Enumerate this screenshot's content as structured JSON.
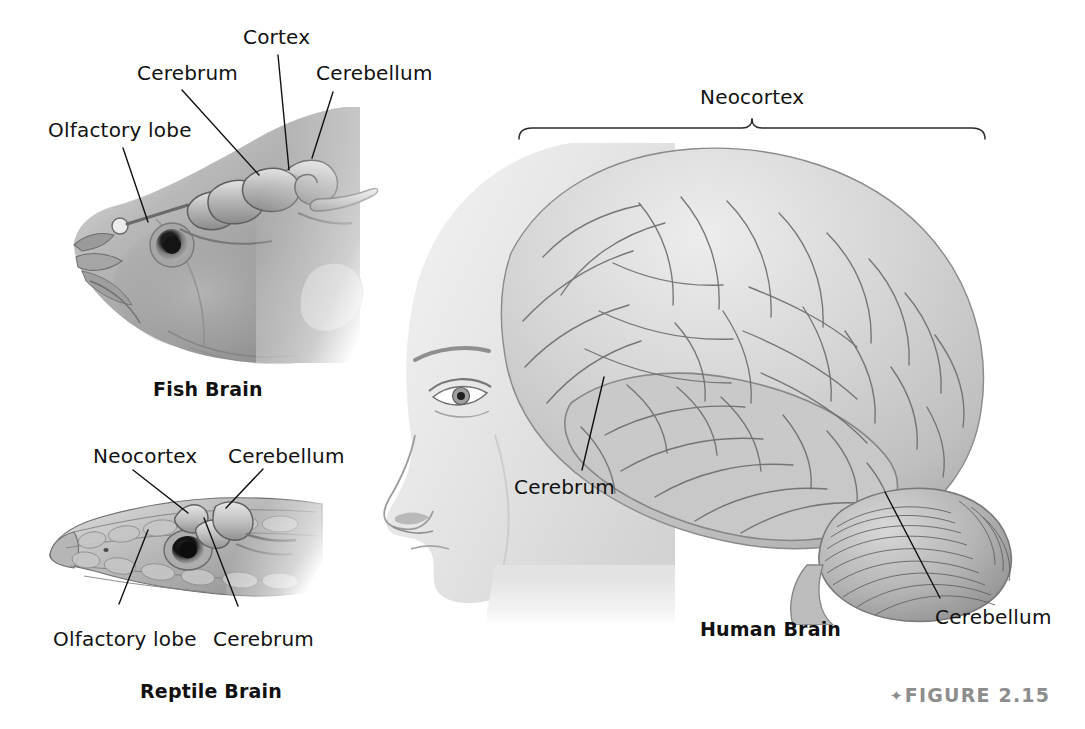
{
  "figure": {
    "number_marker": "✦",
    "number_text": "FIGURE 2.15",
    "background_color": "#ffffff",
    "ink_color": "#111111",
    "caption_gray": "#8d8d8d"
  },
  "panels": [
    {
      "id": "fish",
      "caption": "Fish Brain",
      "labels": [
        {
          "name": "olfactory-lobe",
          "text": "Olfactory lobe"
        },
        {
          "name": "cerebrum",
          "text": "Cerebrum"
        },
        {
          "name": "cortex",
          "text": "Cortex"
        },
        {
          "name": "cerebellum",
          "text": "Cerebellum"
        }
      ]
    },
    {
      "id": "reptile",
      "caption": "Reptile Brain",
      "labels": [
        {
          "name": "neocortex",
          "text": "Neocortex"
        },
        {
          "name": "cerebellum",
          "text": "Cerebellum"
        },
        {
          "name": "olfactory-lobe",
          "text": "Olfactory lobe"
        },
        {
          "name": "cerebrum",
          "text": "Cerebrum"
        }
      ]
    },
    {
      "id": "human",
      "caption": "Human Brain",
      "bracket_label": "Neocortex",
      "labels": [
        {
          "name": "cerebrum",
          "text": "Cerebrum"
        },
        {
          "name": "cerebellum",
          "text": "Cerebellum"
        }
      ]
    }
  ],
  "text": {
    "fish_caption": "Fish Brain",
    "fish_olfactory_lobe": "Olfactory lobe",
    "fish_cerebrum": "Cerebrum",
    "fish_cortex": "Cortex",
    "fish_cerebellum": "Cerebellum",
    "reptile_caption": "Reptile Brain",
    "reptile_neocortex": "Neocortex",
    "reptile_cerebellum": "Cerebellum",
    "reptile_olfactory_lobe": "Olfactory lobe",
    "reptile_cerebrum": "Cerebrum",
    "human_caption": "Human Brain",
    "human_neocortex": "Neocortex",
    "human_cerebrum": "Cerebrum",
    "human_cerebellum": "Cerebellum",
    "figure_marker": "✦",
    "figure_label": "FIGURE 2.15"
  }
}
